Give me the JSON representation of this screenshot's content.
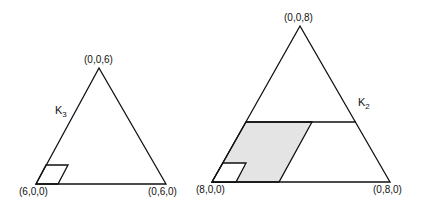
{
  "left_triangle": {
    "name": "K3",
    "label_main": "K",
    "label_sub": "3",
    "vertices": {
      "top": "(0,0,6)",
      "left": "(6,0,0)",
      "right": "(0,6,0)"
    }
  },
  "right_triangle": {
    "name": "K2",
    "label_main": "K",
    "label_sub": "2",
    "vertices": {
      "top": "(0,0,8)",
      "left": "(8,0,0)",
      "right": "(0,8,0)"
    }
  },
  "colors": {
    "stroke": "#111111",
    "shade": "#e4e4e4",
    "background": "#ffffff"
  }
}
